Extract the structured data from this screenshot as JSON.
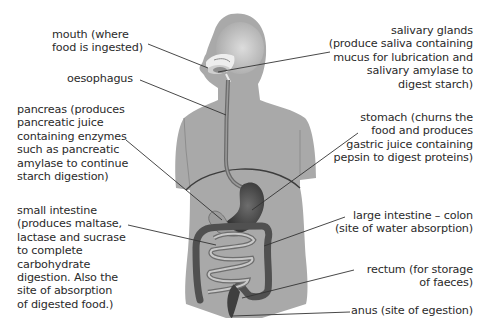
{
  "diagram": {
    "colors": {
      "body_fill": "#a9a9a9",
      "body_highlight": "#d8d8d8",
      "organ_dark": "#4a4a4a",
      "organ_mid": "#6a6a6a",
      "small_intestine": "#bdbdbd",
      "leader_line": "#333333",
      "text": "#2a2a2a"
    },
    "labels": [
      {
        "id": "mouth",
        "text": "mouth (where\nfood is ingested)",
        "side": "left"
      },
      {
        "id": "oesophagus",
        "text": "oesophagus",
        "side": "left"
      },
      {
        "id": "pancreas",
        "text": "pancreas (produces\npancreatic juice\ncontaining enzymes\nsuch as pancreatic\namylase to continue\nstarch digestion)",
        "side": "left"
      },
      {
        "id": "small_intestine",
        "text": "small intestine\n(produces maltase,\nlactase and sucrase\nto complete\ncarbohydrate\ndigestion. Also the\nsite of absorption\nof digested food.)",
        "side": "left"
      },
      {
        "id": "salivary_glands",
        "text": "salivary glands\n(produce saliva containing\nmucus for lubrication and\nsalivary amylase to\ndigest starch)",
        "side": "right"
      },
      {
        "id": "stomach",
        "text": "stomach (churns the\nfood and produces\ngastric juice containing\npepsin to digest proteins)",
        "side": "right"
      },
      {
        "id": "large_intestine",
        "text": "large intestine – colon\n(site of water absorption)",
        "side": "right"
      },
      {
        "id": "rectum",
        "text": "rectum (for storage\nof faeces)",
        "side": "right"
      },
      {
        "id": "anus",
        "text": "anus (site of egestion)",
        "side": "right"
      }
    ]
  }
}
